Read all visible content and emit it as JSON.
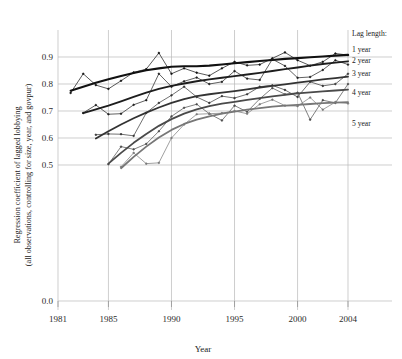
{
  "chart_data": {
    "type": "line",
    "title": "",
    "xlabel": "Year",
    "ylabel_line1": "Regression coefficient of lagged lobbying",
    "ylabel_line2": "(all observations, controlling for size, year, and govpur)",
    "xlim": [
      1981,
      2004
    ],
    "ylim": [
      0.45,
      0.94
    ],
    "xticks": [
      1981,
      1985,
      1990,
      1995,
      2000,
      2004
    ],
    "xticklabels": [
      "1981",
      "1985",
      "1990",
      "1995",
      "2000",
      "2004"
    ],
    "yticks": [
      0.0,
      0.5,
      0.6,
      0.7,
      0.8,
      0.9
    ],
    "yticklabels": [
      "0.0",
      "0.5",
      "0.6",
      "0.7",
      "0.8",
      "0.9"
    ],
    "y_axis_break": true,
    "grid": true,
    "legend_position": "right",
    "legend_title": "Lag length:",
    "series": [
      {
        "name": "1 year",
        "color": "#111111",
        "width": 2.1,
        "x": [
          1982,
          1983,
          1984,
          1985,
          1986,
          1987,
          1988,
          1989,
          1990,
          1991,
          1992,
          1993,
          1994,
          1995,
          1996,
          1997,
          1998,
          1999,
          2000,
          2001,
          2002,
          2003,
          2004
        ],
        "values": [
          0.767,
          0.838,
          0.796,
          0.782,
          0.812,
          0.843,
          0.855,
          0.915,
          0.838,
          0.858,
          0.842,
          0.831,
          0.858,
          0.882,
          0.869,
          0.872,
          0.895,
          0.917,
          0.888,
          0.868,
          0.882,
          0.913,
          0.907
        ],
        "smooth": [
          0.775,
          0.79,
          0.805,
          0.818,
          0.83,
          0.841,
          0.851,
          0.858,
          0.864,
          0.866,
          0.866,
          0.868,
          0.872,
          0.877,
          0.881,
          0.885,
          0.889,
          0.893,
          0.896,
          0.899,
          0.902,
          0.905,
          0.908
        ]
      },
      {
        "name": "2 year",
        "color": "#1d1d1d",
        "width": 1.9,
        "x": [
          1983,
          1984,
          1985,
          1986,
          1987,
          1988,
          1989,
          1990,
          1991,
          1992,
          1993,
          1994,
          1995,
          1996,
          1997,
          1998,
          1999,
          2000,
          2001,
          2002,
          2003,
          2004
        ],
        "values": [
          0.693,
          0.722,
          0.688,
          0.69,
          0.723,
          0.74,
          0.838,
          0.79,
          0.81,
          0.824,
          0.8,
          0.808,
          0.848,
          0.82,
          0.815,
          0.892,
          0.867,
          0.823,
          0.826,
          0.852,
          0.888,
          0.872
        ],
        "smooth": [
          0.692,
          0.706,
          0.72,
          0.736,
          0.752,
          0.768,
          0.782,
          0.793,
          0.802,
          0.81,
          0.817,
          0.823,
          0.829,
          0.835,
          0.841,
          0.848,
          0.855,
          0.861,
          0.868,
          0.874,
          0.879,
          0.884
        ]
      },
      {
        "name": "3 year",
        "color": "#333333",
        "width": 1.8,
        "x": [
          1984,
          1985,
          1986,
          1987,
          1988,
          1989,
          1990,
          1991,
          1992,
          1993,
          1994,
          1995,
          1996,
          1997,
          1998,
          1999,
          2000,
          2001,
          2002,
          2003,
          2004
        ],
        "values": [
          0.612,
          0.615,
          0.614,
          0.608,
          0.693,
          0.73,
          0.758,
          0.79,
          0.752,
          0.73,
          0.755,
          0.748,
          0.762,
          0.79,
          0.795,
          0.778,
          0.752,
          0.808,
          0.793,
          0.8,
          0.838
        ],
        "smooth": [
          0.598,
          0.625,
          0.65,
          0.673,
          0.694,
          0.713,
          0.73,
          0.744,
          0.755,
          0.762,
          0.768,
          0.774,
          0.78,
          0.787,
          0.793,
          0.799,
          0.805,
          0.811,
          0.817,
          0.822,
          0.827
        ]
      },
      {
        "name": "4 year",
        "color": "#4a4a4a",
        "width": 1.8,
        "x": [
          1985,
          1986,
          1987,
          1988,
          1989,
          1990,
          1991,
          1992,
          1993,
          1994,
          1995,
          1996,
          1997,
          1998,
          1999,
          2000,
          2001,
          2002,
          2003,
          2004
        ],
        "values": [
          0.503,
          0.568,
          0.558,
          0.578,
          0.625,
          0.68,
          0.712,
          0.725,
          0.69,
          0.665,
          0.72,
          0.697,
          0.745,
          0.785,
          0.762,
          0.768,
          0.668,
          0.74,
          0.73,
          0.8
        ],
        "smooth": [
          0.505,
          0.545,
          0.582,
          0.615,
          0.645,
          0.67,
          0.69,
          0.706,
          0.718,
          0.727,
          0.734,
          0.741,
          0.748,
          0.754,
          0.76,
          0.765,
          0.769,
          0.773,
          0.776,
          0.779
        ]
      },
      {
        "name": "5 year",
        "color": "#777777",
        "width": 1.8,
        "x": [
          1986,
          1987,
          1988,
          1989,
          1990,
          1991,
          1992,
          1993,
          1994,
          1995,
          1996,
          1997,
          1998,
          1999,
          2000,
          2001,
          2002,
          2003,
          2004
        ],
        "values": [
          0.493,
          0.545,
          0.505,
          0.508,
          0.6,
          0.65,
          0.688,
          0.69,
          0.692,
          0.7,
          0.69,
          0.725,
          0.742,
          0.72,
          0.718,
          0.75,
          0.705,
          0.733,
          0.728
        ],
        "smooth": [
          0.488,
          0.53,
          0.568,
          0.602,
          0.63,
          0.652,
          0.668,
          0.68,
          0.69,
          0.698,
          0.705,
          0.711,
          0.716,
          0.72,
          0.723,
          0.726,
          0.729,
          0.731,
          0.733
        ]
      }
    ]
  },
  "legend": {
    "title": "Lag length:",
    "entries": [
      {
        "label": "1 year"
      },
      {
        "label": "2 year"
      },
      {
        "label": "3 year"
      },
      {
        "label": "4 year"
      },
      {
        "label": "5 year"
      }
    ]
  },
  "axes": {
    "x_title": "Year",
    "y_title_line1": "Regression coefficient of lagged lobbying",
    "y_title_line2": "(all observations, controlling for size, year, and govpur)"
  }
}
